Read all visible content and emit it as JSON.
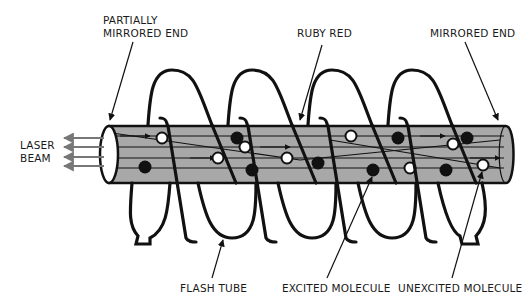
{
  "labels": {
    "partially_mirrored_end_line1": "PARTIALLY",
    "partially_mirrored_end_line2": "MIRRORED END",
    "ruby_red": "RUBY RED",
    "mirrored_end": "MIRRORED END",
    "laser_beam_line1": "LASER",
    "laser_beam_line2": "BEAM",
    "flash_tube": "FLASH TUBE",
    "excited_molecule": "EXCITED MOLECULE",
    "unexcited_molecule": "UNEXCITED MOLECULE"
  },
  "colors": {
    "rod_fill": "#a8a8a8",
    "line": "#111111",
    "beam_arrow": "#777777",
    "excited": "#111111",
    "unexcited": "#ffffff"
  },
  "molecules": {
    "excited": [
      [
        145,
        167
      ],
      [
        237,
        138
      ],
      [
        252,
        170
      ],
      [
        318,
        163
      ],
      [
        373,
        170
      ],
      [
        398,
        138
      ],
      [
        446,
        170
      ],
      [
        467,
        138
      ]
    ],
    "unexcited": [
      [
        162,
        138
      ],
      [
        218,
        158
      ],
      [
        245,
        147
      ],
      [
        287,
        158
      ],
      [
        351,
        136
      ],
      [
        410,
        168
      ],
      [
        453,
        144
      ],
      [
        483,
        165
      ]
    ]
  }
}
